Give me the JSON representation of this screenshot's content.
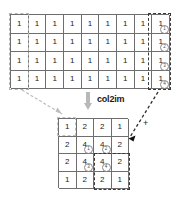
{
  "diagram": {
    "title": "col2im",
    "operation_label": "col2im",
    "plus_label": "+",
    "colors": {
      "grid_line": "#6e6e6e",
      "text": "#1a1a1a",
      "arrow": "#b9b9b9",
      "highlight_dash_dark": "#3a3a3a",
      "highlight_dash_light": "#b6b6b6"
    },
    "source_matrix": {
      "name": "col-matrix",
      "rows": 4,
      "cols": 9,
      "values": [
        [
          "1",
          "1",
          "1",
          "1",
          "1",
          "1",
          "1",
          "1",
          "1"
        ],
        [
          "1",
          "1",
          "1",
          "1",
          "1",
          "1",
          "1",
          "1",
          "1"
        ],
        [
          "1",
          "1",
          "1",
          "1",
          "1",
          "1",
          "1",
          "1",
          "1"
        ],
        [
          "1",
          "1",
          "1",
          "1",
          "1",
          "1",
          "1",
          "1",
          "1"
        ]
      ],
      "last_column_markers": [
        "1",
        "2",
        "3",
        "4"
      ]
    },
    "target_matrix": {
      "name": "image-matrix",
      "rows": 4,
      "cols": 4,
      "values": [
        [
          "1",
          "2",
          "2",
          "1"
        ],
        [
          "2",
          "4",
          "4",
          "2"
        ],
        [
          "2",
          "4",
          "4",
          "2"
        ],
        [
          "1",
          "2",
          "2",
          "1"
        ]
      ],
      "block_markers": {
        "r2c2": "1",
        "r2c3": "2",
        "r3c2": "3",
        "r3c3": "4"
      }
    }
  }
}
